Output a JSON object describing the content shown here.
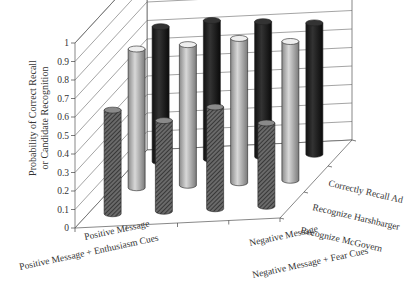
{
  "chart_data": {
    "type": "bar",
    "subtype": "3d-cylinder",
    "title": "",
    "ylabel": "Probability of Correct Recall or Candidate Recognition",
    "ylabel_lines": [
      "Probability of Correct Recall",
      "or Candidate Recognition"
    ],
    "xlabel": "",
    "ylim": [
      0,
      1
    ],
    "yticks": [
      "0",
      "0.1",
      "0.2",
      "0.3",
      "0.4",
      "0.5",
      "0.6",
      "0.7",
      "0.8",
      "0.9",
      "1"
    ],
    "categories": [
      "Positive Message",
      "Positive Message + Enthusiasm Cues",
      "Negative Message",
      "Negative Message + Fear Cues"
    ],
    "series": [
      {
        "name": "Recognize McGovern",
        "pattern": "hatched",
        "values": [
          0.56,
          0.49,
          0.55,
          0.45
        ]
      },
      {
        "name": "Recognize Harshbarger",
        "pattern": "light-gray",
        "values": [
          0.75,
          0.76,
          0.78,
          0.75
        ]
      },
      {
        "name": "Correctly Recall Ad",
        "pattern": "black",
        "values": [
          0.73,
          0.75,
          0.73,
          0.71
        ]
      }
    ],
    "grid": true,
    "legend_position": "depth-axis-right"
  }
}
